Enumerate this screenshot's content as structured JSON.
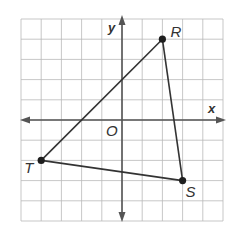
{
  "figure": {
    "type": "coordinate-plane",
    "grid": {
      "x_min": -5,
      "x_max": 5,
      "y_min": -5,
      "y_max": 5,
      "step": 1
    },
    "axes": {
      "x_label": "x",
      "y_label": "y",
      "origin_label": "O"
    },
    "triangle": {
      "vertices": [
        {
          "name": "R",
          "x": 2,
          "y": 4
        },
        {
          "name": "S",
          "x": 3,
          "y": -3
        },
        {
          "name": "T",
          "x": -4,
          "y": -2
        }
      ],
      "edges": [
        [
          "R",
          "S"
        ],
        [
          "S",
          "T"
        ],
        [
          "T",
          "R"
        ]
      ]
    },
    "colors": {
      "grid": "#b9b9b9",
      "axis": "#555555",
      "edge": "#333333",
      "point": "#1e1e1e"
    }
  }
}
